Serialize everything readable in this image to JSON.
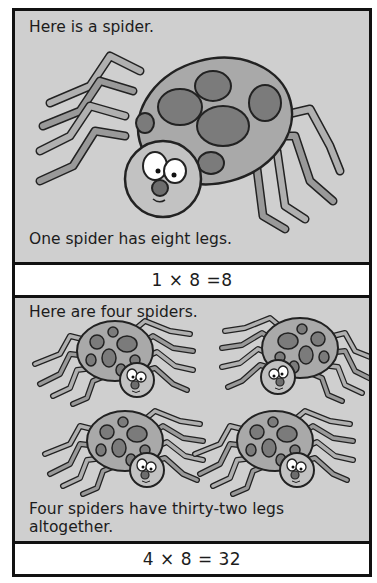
{
  "page": {
    "panels": [
      {
        "heading": "Here is a spider.",
        "caption": "One spider has eight legs.",
        "illustration": "spider-icon",
        "spider_count": 1,
        "formula": "1 × 8 =8"
      },
      {
        "heading": "Here are four spiders.",
        "caption_line1": "Four spiders have thirty-two legs",
        "caption_line2": "altogether.",
        "illustration": "spider-icon",
        "spider_count": 4,
        "formula": "4 × 8 = 32"
      }
    ]
  },
  "colors": {
    "panel_fill": "#cfcfcf",
    "border": "#111111",
    "spider_body": "#a9a9a9",
    "spider_spots": "#7b7b7b",
    "leg_light": "#b5b5b5",
    "leg_dark": "#7f7f7f"
  }
}
